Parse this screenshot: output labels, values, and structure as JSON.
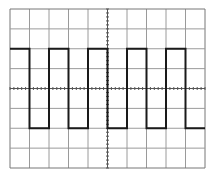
{
  "diagram": {
    "type": "oscilloscope-square-wave",
    "grid": {
      "columns": 10,
      "rows": 8,
      "left": 10,
      "top": 9,
      "width": 195,
      "height": 159,
      "line_color": "#9a9a9a",
      "border_color": "#777777"
    },
    "axes": {
      "tick_color": "#555555",
      "center_x_division": 5,
      "center_y_division": 4,
      "minor_ticks_per_division": 5
    },
    "waveform": {
      "color": "#1a1a1a",
      "stroke_width": 2,
      "high_division": 2,
      "low_division": 6,
      "transitions_x_divisions": [
        1,
        2,
        3,
        4,
        5,
        6,
        7,
        8,
        9
      ],
      "starts": "high"
    }
  }
}
